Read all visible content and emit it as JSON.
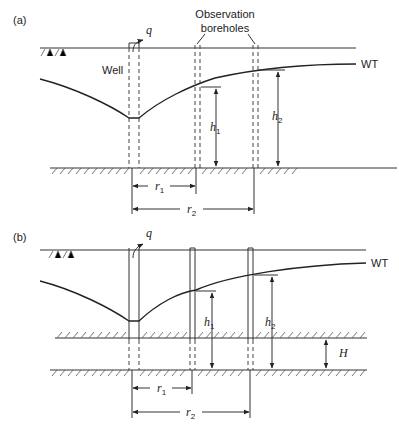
{
  "figure": {
    "panel_a": {
      "label": "(a)",
      "well_label": "Well",
      "discharge_label": "q",
      "obs_label_line1": "Observation",
      "obs_label_line2": "boreholes",
      "wt_label": "WT",
      "h1_label": "h",
      "h1_sub": "1",
      "h2_label": "h",
      "h2_sub": "2",
      "r1_label": "r",
      "r1_sub": "1",
      "r2_label": "r",
      "r2_sub": "2"
    },
    "panel_b": {
      "label": "(b)",
      "discharge_label": "q",
      "wt_label": "WT",
      "h1_label": "h",
      "h1_sub": "1",
      "h2_label": "h",
      "h2_sub": "2",
      "H_label": "H",
      "r1_label": "r",
      "r1_sub": "1",
      "r2_label": "r",
      "r2_sub": "2"
    }
  }
}
